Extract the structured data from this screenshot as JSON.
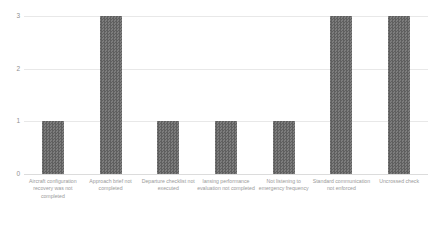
{
  "chart_data": {
    "type": "bar",
    "title": "",
    "subtitle": "",
    "xlabel": "",
    "ylabel": "",
    "ylim": [
      0,
      3
    ],
    "yticks": [
      "0",
      "1",
      "2",
      "3"
    ],
    "grid": true,
    "legend": false,
    "orientation": "vertical",
    "bar_color": "#6e6e6e",
    "gridline_color": "#e8e8e8",
    "categories": [
      "Aircraft configuration recovery was not completed",
      "Approach brief not completed",
      "Departure checklist not executed",
      "lansing performance evaluation not completed",
      "Not listening to emergency frequency",
      "Standard communication not enforced",
      "Uncrossed check"
    ],
    "values": [
      1,
      3,
      1,
      1,
      1,
      3,
      3
    ]
  }
}
